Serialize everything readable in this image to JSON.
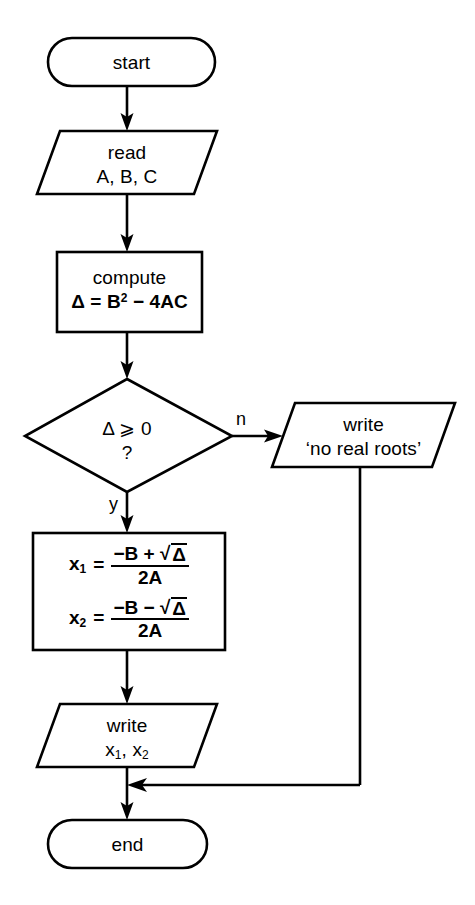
{
  "diagram": {
    "background_color": "#ffffff",
    "line_color": "#000000",
    "nodes": {
      "start": {
        "shape": "terminator",
        "label": "start"
      },
      "read": {
        "shape": "parallelogram",
        "line1": "read",
        "line2": "A, B, C"
      },
      "compute": {
        "shape": "process",
        "line1": "compute",
        "line2_lhs": "Δ = B",
        "line2_sup": "2",
        "line2_rest": " − 4AC"
      },
      "decision": {
        "shape": "diamond",
        "line1": "Δ ⩾ 0",
        "line2": "?"
      },
      "no_roots": {
        "shape": "parallelogram",
        "line1": "write",
        "line2": "‘no real roots’"
      },
      "roots": {
        "shape": "process",
        "formulas": [
          {
            "lhs": "x",
            "lhs_sub": "1",
            "eq": "=",
            "num_sign": "−B +",
            "num_radicand": "Δ",
            "den": "2A"
          },
          {
            "lhs": "x",
            "lhs_sub": "2",
            "eq": "=",
            "num_sign": "−B −",
            "num_radicand": "Δ",
            "den": "2A"
          }
        ],
        "sqrt_symbol": "√"
      },
      "write_roots": {
        "shape": "parallelogram",
        "line1": "write",
        "line2_a": "x",
        "line2_a_sub": "1",
        "line2_sep": ", ",
        "line2_b": "x",
        "line2_b_sub": "2"
      },
      "end": {
        "shape": "terminator",
        "label": "end"
      }
    },
    "branch_labels": {
      "no": "n",
      "yes": "y"
    }
  }
}
